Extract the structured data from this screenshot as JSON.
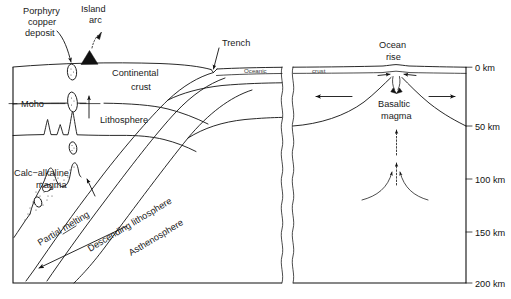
{
  "figure": {
    "type": "geological-cross-section"
  },
  "labels": {
    "porphyry_copper_deposit": "Porphyry\ncopper\ndeposit",
    "porphyry_line1": "Porphyry",
    "porphyry_line2": "copper",
    "porphyry_line3": "deposit",
    "island_arc_line1": "Island",
    "island_arc_line2": "arc",
    "trench": "Trench",
    "continental_crust_line1": "Continental",
    "continental_crust_line2": "crust",
    "moho": "Moho",
    "lithosphere": "Lithosphere",
    "calc_alkaline_line1": "Calc−alkaline",
    "calc_alkaline_line2": "magma",
    "partial_melting": "Partial melting",
    "descending_lithosphere": "Descending lithosphere",
    "asthenosphere": "Asthenosphere",
    "oceanic": "Oceanic",
    "crust": "crust",
    "ocean_rise_line1": "Ocean",
    "ocean_rise_line2": "rise",
    "basaltic_magma_line1": "Basaltic",
    "basaltic_magma_line2": "magma"
  },
  "depth_scale": {
    "unit": "km",
    "ticks": [
      {
        "label": "0 km",
        "depth_km": 0,
        "y": 68
      },
      {
        "label": "50 km",
        "depth_km": 50,
        "y": 126
      },
      {
        "label": "100 km",
        "depth_km": 100,
        "y": 179
      },
      {
        "label": "150 km",
        "depth_km": 150,
        "y": 232
      },
      {
        "label": "200 km",
        "depth_km": 200,
        "y": 283
      }
    ]
  },
  "colors": {
    "ink": "#111111",
    "background": "#ffffff",
    "label_text": "#1a1a1a",
    "small_text": "#3a3a3a"
  },
  "annotations": {
    "flow_arrow_left": "spreading-arrow-left",
    "flow_arrow_right": "spreading-arrow-right",
    "upwelling_arrow": "mantle-upwelling-arrow",
    "subduction_arrow": "slab-descent-arrow",
    "magma_ascent_arrow": "magma-ascent-arrow"
  }
}
